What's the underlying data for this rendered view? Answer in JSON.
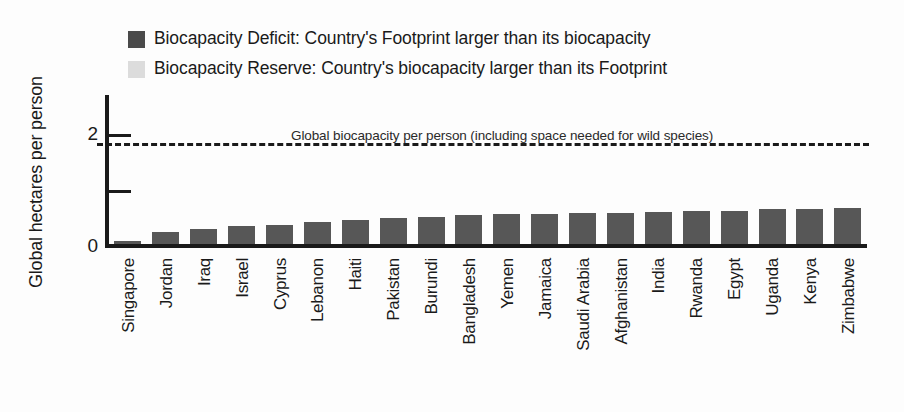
{
  "chart_data": {
    "type": "bar",
    "title": "",
    "xlabel": "",
    "ylabel": "Global hectares per person",
    "ylim": [
      0,
      2.45
    ],
    "yticks": [
      0,
      1,
      2
    ],
    "ytick_labels": [
      "0",
      "",
      "2"
    ],
    "grid": false,
    "bar_color": "#575757",
    "categories": [
      "Singapore",
      "Jordan",
      "Iraq",
      "Israel",
      "Cyprus",
      "Lebanon",
      "Haiti",
      "Pakistan",
      "Burundi",
      "Bangladesh",
      "Yemen",
      "Jamaica",
      "Saudi Arabia",
      "Afghanistan",
      "India",
      "Rwanda",
      "Egypt",
      "Uganda",
      "Kenya",
      "Zimbabwe"
    ],
    "values": [
      0.05,
      0.2,
      0.25,
      0.29,
      0.32,
      0.36,
      0.39,
      0.42,
      0.45,
      0.48,
      0.5,
      0.5,
      0.51,
      0.51,
      0.52,
      0.54,
      0.55,
      0.57,
      0.57,
      0.59
    ],
    "annotations": [
      {
        "name": "global-biocapacity-line",
        "text": "Global biocapacity per person (including space needed for wild species)",
        "value": 1.72,
        "style": "dashed"
      }
    ],
    "legend": {
      "position": "top-left",
      "entries": [
        {
          "label": "Biocapacity Deficit: Country's Footprint larger than its biocapacity",
          "color": "#4a4a4a"
        },
        {
          "label": "Biocapacity Reserve: Country's biocapacity larger than its Footprint",
          "color": "#dcdcdc"
        }
      ]
    }
  }
}
